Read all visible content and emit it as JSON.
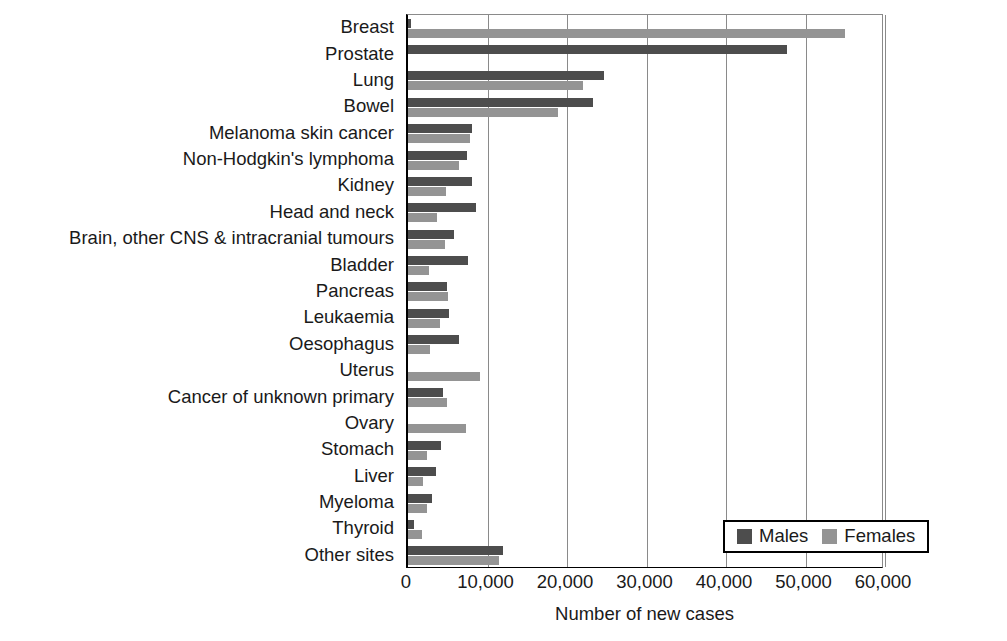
{
  "chart_data": {
    "type": "bar",
    "orientation": "horizontal",
    "title": "",
    "xlabel": "Number of new cases",
    "ylabel": "",
    "xlim": [
      0,
      60000
    ],
    "xticks": [
      0,
      10000,
      20000,
      30000,
      40000,
      50000,
      60000
    ],
    "xticklabels": [
      "0",
      "10,000",
      "20,000",
      "30,000",
      "40,000",
      "50,000",
      "60,000"
    ],
    "grid": "vertical",
    "legend_position": "bottom-right",
    "categories": [
      "Breast",
      "Prostate",
      "Lung",
      "Bowel",
      "Melanoma skin cancer",
      "Non-Hodgkin's lymphoma",
      "Kidney",
      "Head and neck",
      "Brain, other CNS & intracranial tumours",
      "Bladder",
      "Pancreas",
      "Leukaemia",
      "Oesophagus",
      "Uterus",
      "Cancer of unknown primary",
      "Ovary",
      "Stomach",
      "Liver",
      "Myeloma",
      "Thyroid",
      "Other sites"
    ],
    "series": [
      {
        "name": "Males",
        "color": "#4d4d4d",
        "values": [
          350,
          47700,
          24600,
          23300,
          8000,
          7400,
          8100,
          8500,
          5800,
          7500,
          4900,
          5200,
          6400,
          0,
          4400,
          0,
          4200,
          3500,
          3000,
          700,
          11900
        ]
      },
      {
        "name": "Females",
        "color": "#949494",
        "values": [
          55000,
          0,
          22000,
          18900,
          7800,
          6400,
          4800,
          3700,
          4700,
          2700,
          5000,
          4000,
          2800,
          9000,
          4900,
          7300,
          2400,
          1900,
          2400,
          1800,
          11500
        ]
      }
    ]
  },
  "legend": {
    "items": [
      {
        "label": "Males",
        "color": "#4d4d4d"
      },
      {
        "label": "Females",
        "color": "#949494"
      }
    ]
  },
  "colors": {
    "male_bar": "#4d4d4d",
    "female_bar": "#949494",
    "gridline": "#8a8a8a",
    "axis": "#000000",
    "text": "#1a1a1a",
    "background": "#ffffff"
  }
}
